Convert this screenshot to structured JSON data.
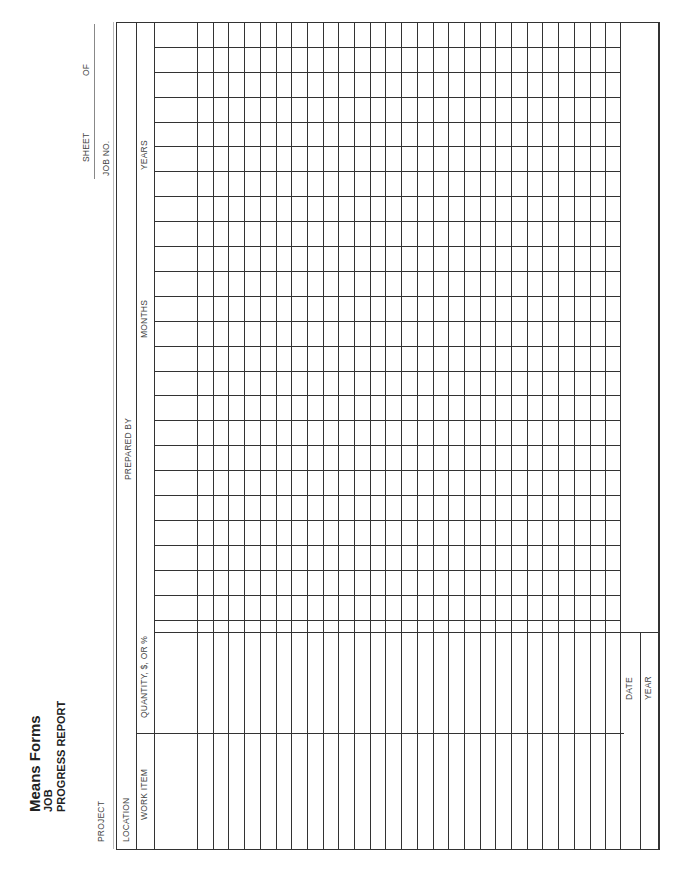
{
  "header": {
    "brand": "Means Forms",
    "title_line1": "JOB",
    "title_line2": "PROGRESS REPORT"
  },
  "fields": {
    "project_label": "PROJECT",
    "location_label": "LOCATION",
    "prepared_by_label": "PREPARED BY",
    "sheet_label": "SHEET",
    "of_label": "OF",
    "job_no_label": "JOB NO."
  },
  "columns": {
    "work_item": "WORK ITEM",
    "quantity": "QUANTITY, $, OR %",
    "months": "MONTHS",
    "years": "YEARS",
    "date": "DATE",
    "year": "YEAR"
  },
  "grid": {
    "rows": 27,
    "month_columns": 24
  }
}
